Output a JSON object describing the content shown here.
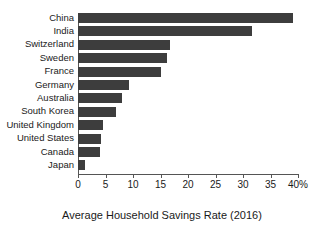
{
  "chart_data": {
    "type": "bar",
    "orientation": "horizontal",
    "title": "",
    "xlabel": "Average Household Savings Rate (2016)",
    "ylabel": "",
    "categories": [
      "China",
      "India",
      "Switzerland",
      "Sweden",
      "France",
      "Germany",
      "Australia",
      "South Korea",
      "United Kingdom",
      "United States",
      "Canada",
      "Japan"
    ],
    "values": [
      39.1,
      31.6,
      16.7,
      16.2,
      15.1,
      9.3,
      8.0,
      6.9,
      4.5,
      4.1,
      4.0,
      1.3
    ],
    "series": [
      {
        "name": "Average Household Savings Rate (2016)",
        "values": [
          39.1,
          31.6,
          16.7,
          16.2,
          15.1,
          9.3,
          8.0,
          6.9,
          4.5,
          4.1,
          4.0,
          1.3
        ]
      }
    ],
    "xlim": [
      0,
      40
    ],
    "x_ticks": [
      0,
      5,
      10,
      15,
      20,
      25,
      30,
      35,
      40
    ],
    "x_tick_labels": [
      "0",
      "5",
      "10",
      "15",
      "20",
      "25",
      "30",
      "35",
      "40%"
    ],
    "grid": false,
    "legend": false,
    "legend_position": "none",
    "bar_color": "#3d3d3d",
    "axis_color": "#555555",
    "background_color": "#ffffff"
  },
  "axis": {
    "title": "Average Household Savings Rate (2016)"
  }
}
